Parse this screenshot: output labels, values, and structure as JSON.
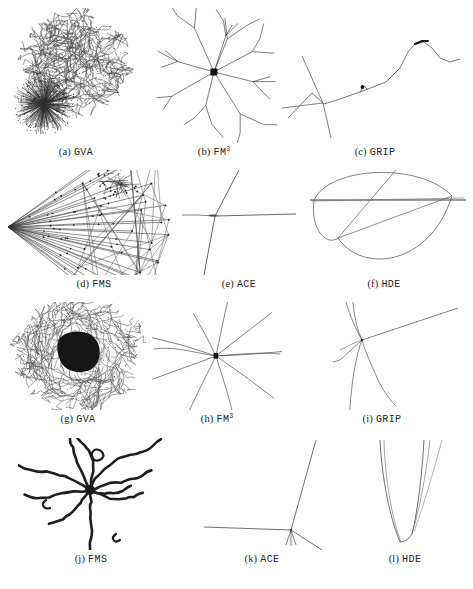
{
  "figure": {
    "type": "graph-drawing-comparison-grid",
    "background_color": "#fefefe",
    "ink_color": "#2b2b2b",
    "rows": 4,
    "columns": 3
  },
  "panels": [
    {
      "id": "a",
      "index_label": "(a)",
      "algorithm": "GVA",
      "superscript": "",
      "description": "dense tangled hairball with radial burst cluster at lower left",
      "drawing": "gva-tangle-with-burst"
    },
    {
      "id": "b",
      "index_label": "(b)",
      "algorithm": "FM",
      "superscript": "3",
      "description": "radial tree with black square hub and branching arms",
      "drawing": "fm3-radial-tree"
    },
    {
      "id": "c",
      "index_label": "(c)",
      "algorithm": "GRIP",
      "superscript": "",
      "description": "thin wavy filament with small star junction at left and dark node near peak",
      "drawing": "grip-filament"
    },
    {
      "id": "d",
      "index_label": "(d)",
      "algorithm": "FMS",
      "superscript": "",
      "description": "long straight edges fanning from a left apex with scattered nodes",
      "drawing": "fms-fan"
    },
    {
      "id": "e",
      "index_label": "(e)",
      "algorithm": "ACE",
      "superscript": "",
      "description": "three-pronged Y shape collapsed to a single junction",
      "drawing": "ace-y"
    },
    {
      "id": "f",
      "index_label": "(f)",
      "algorithm": "HDE",
      "superscript": "",
      "description": "lens shaped arcs crossed by straight chords",
      "drawing": "hde-lens"
    },
    {
      "id": "g",
      "index_label": "(g)",
      "algorithm": "GVA",
      "superscript": "",
      "description": "dense circular tangle around a solid black blob core",
      "drawing": "gva-blob"
    },
    {
      "id": "h",
      "index_label": "(h)",
      "algorithm": "FM",
      "superscript": "3",
      "description": "eight-spoke star burst around a small black square hub",
      "drawing": "fm3-star"
    },
    {
      "id": "i",
      "index_label": "(i)",
      "algorithm": "GRIP",
      "superscript": "",
      "description": "thin curved strands converging into one junction",
      "drawing": "grip-converge"
    },
    {
      "id": "j",
      "index_label": "(j)",
      "algorithm": "FMS",
      "superscript": "",
      "description": "thick spidery star with wiggly dark arms",
      "drawing": "fms-spider"
    },
    {
      "id": "k",
      "index_label": "(k)",
      "algorithm": "ACE",
      "superscript": "",
      "description": "junction at lower right with horizontal edge and diagonal edges",
      "drawing": "ace-junction"
    },
    {
      "id": "l",
      "index_label": "(l)",
      "algorithm": "HDE",
      "superscript": "",
      "description": "narrow vertical U of converging near-parallel curves",
      "drawing": "hde-u"
    }
  ]
}
